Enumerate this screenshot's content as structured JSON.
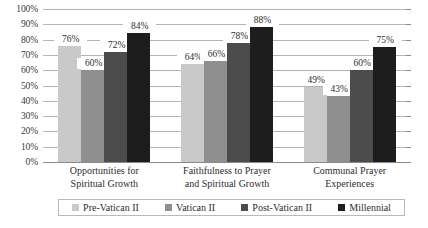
{
  "chart_data": {
    "type": "bar",
    "title": "",
    "subtitle": "",
    "xlabel": "",
    "ylabel": "",
    "ylim": [
      0,
      100
    ],
    "y_unit": "%",
    "grid": true,
    "legend_position": "bottom",
    "categories": [
      "Opportunities for Spiritual Growth",
      "Faithfulness to Prayer and Spiritual Growth",
      "Communal Prayer Experiences"
    ],
    "category_lines": [
      [
        "Opportunities for",
        "Spiritual Growth"
      ],
      [
        "Faithfulness to Prayer",
        "and Spiritual Growth"
      ],
      [
        "Communal Prayer",
        "Experiences"
      ]
    ],
    "series": [
      {
        "name": "Pre-Vatican II",
        "color": "#c9c9c9",
        "values": [
          76,
          64,
          49
        ],
        "labels": [
          "76%",
          "64%",
          "49%"
        ]
      },
      {
        "name": "Vatican II",
        "color": "#8f8f8f",
        "values": [
          60,
          66,
          43
        ],
        "labels": [
          "60%",
          "66%",
          "43%"
        ]
      },
      {
        "name": "Post-Vatican II",
        "color": "#4c4c4c",
        "values": [
          72,
          78,
          60
        ],
        "labels": [
          "72%",
          "78%",
          "60%"
        ]
      },
      {
        "name": "Millennial",
        "color": "#1d1d1d",
        "values": [
          84,
          88,
          75
        ],
        "labels": [
          "84%",
          "88%",
          "75%"
        ]
      }
    ],
    "y_ticks": [
      {
        "value": 100,
        "label": "100%"
      },
      {
        "value": 90,
        "label": "90%"
      },
      {
        "value": 80,
        "label": "80%"
      },
      {
        "value": 70,
        "label": "70%"
      },
      {
        "value": 60,
        "label": "60%"
      },
      {
        "value": 50,
        "label": "50%"
      },
      {
        "value": 40,
        "label": "40%"
      },
      {
        "value": 30,
        "label": "30%"
      },
      {
        "value": 20,
        "label": "20%"
      },
      {
        "value": 10,
        "label": "10%"
      },
      {
        "value": 0,
        "label": "0%"
      }
    ]
  },
  "legend": {
    "items": [
      {
        "label": "Pre-Vatican II",
        "color": "#c9c9c9"
      },
      {
        "label": "Vatican II",
        "color": "#8f8f8f"
      },
      {
        "label": "Post-Vatican II",
        "color": "#4c4c4c"
      },
      {
        "label": "Millennial",
        "color": "#1d1d1d"
      }
    ]
  }
}
